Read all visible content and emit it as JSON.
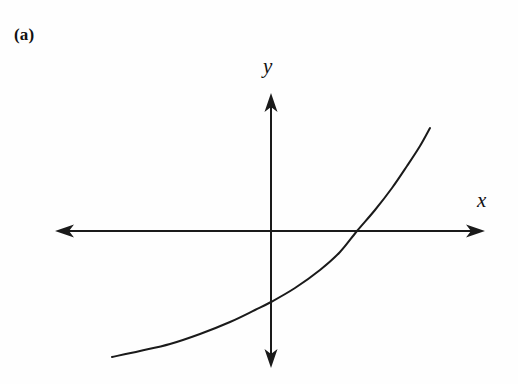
{
  "figure": {
    "panel_label": "(a)",
    "background_color": "#fefefe",
    "stroke_color": "#1a1a1a",
    "width": 518,
    "height": 384
  },
  "axes": {
    "x": {
      "label": "x",
      "origin_px": [
        271,
        231
      ],
      "start_px": [
        55,
        231
      ],
      "end_px": [
        485,
        231
      ],
      "arrow_start": true,
      "arrow_end": true
    },
    "y": {
      "label": "y",
      "origin_px": [
        271,
        231
      ],
      "start_px": [
        271,
        368
      ],
      "end_px": [
        271,
        93
      ],
      "arrow_start": true,
      "arrow_end": true
    }
  },
  "chart_data": {
    "type": "line",
    "title": "(a)",
    "xlabel": "x",
    "ylabel": "y",
    "grid": false,
    "legend": null,
    "annotations": [],
    "axis_crossings": {
      "y_intercept_px": [
        271,
        302
      ],
      "x_intercept_px": [
        357,
        231
      ]
    },
    "xlim": [
      -3.6,
      2.7
    ],
    "ylim": [
      -2.3,
      1.8
    ],
    "x": [
      -3.6,
      -3.2,
      -2.8,
      -2.4,
      -2.0,
      -1.6,
      -1.2,
      -0.8,
      -0.4,
      0.0,
      0.4,
      0.8,
      1.2,
      1.6,
      2.0,
      2.4,
      2.7
    ],
    "y": [
      -2.12,
      -2.04,
      -1.96,
      -1.86,
      -1.74,
      -1.6,
      -1.44,
      -1.24,
      -1.0,
      -0.72,
      -0.38,
      0.03,
      0.52,
      1.1,
      1.78,
      2.56,
      3.2
    ],
    "series": [
      {
        "name": "curve",
        "points_px": [
          [
            112,
            357
          ],
          [
            140,
            351
          ],
          [
            170,
            344
          ],
          [
            200,
            334
          ],
          [
            230,
            322
          ],
          [
            255,
            310
          ],
          [
            271,
            302
          ],
          [
            295,
            288
          ],
          [
            320,
            270
          ],
          [
            340,
            252
          ],
          [
            357,
            231
          ],
          [
            375,
            210
          ],
          [
            392,
            188
          ],
          [
            407,
            166
          ],
          [
            420,
            146
          ],
          [
            430,
            128
          ]
        ]
      }
    ]
  }
}
